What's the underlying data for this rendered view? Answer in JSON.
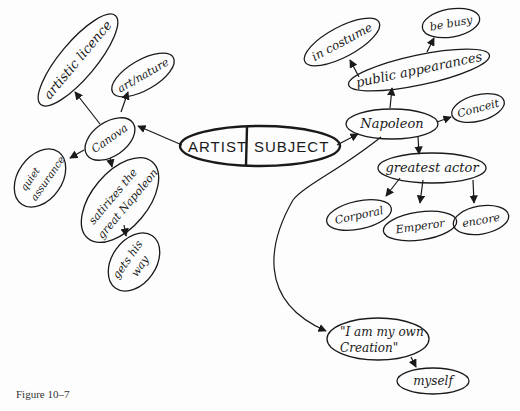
{
  "diagram": {
    "center": {
      "left": "ARTIST",
      "right": "SUBJECT"
    },
    "artist_branch": {
      "root": "Canova",
      "children": [
        {
          "label": "artistic licence"
        },
        {
          "label": "art/nature"
        },
        {
          "label": "quiet assurance"
        },
        {
          "label": "satirizes the great Napoleon",
          "children": [
            {
              "label": "gets his way"
            }
          ]
        }
      ]
    },
    "subject_branch": {
      "root": "Napoleon",
      "children": [
        {
          "label": "public appearances",
          "children": [
            {
              "label": "in costume"
            },
            {
              "label": "be busy"
            }
          ]
        },
        {
          "label": "Conceit"
        },
        {
          "label": "greatest actor",
          "children": [
            {
              "label": "Corporal"
            },
            {
              "label": "Emperor"
            },
            {
              "label": "encore"
            }
          ]
        },
        {
          "label": "\"I am my own Creation\"",
          "children": [
            {
              "label": "myself"
            }
          ]
        }
      ]
    },
    "labels": {
      "artistic_licence": "artistic licence",
      "art_nature": "art/nature",
      "canova": "Canova",
      "quiet_1": "quiet",
      "quiet_2": "assurance",
      "satirizes_1": "satirizes the",
      "satirizes_2": "great Napoleon",
      "gets_1": "gets his",
      "gets_2": "way",
      "napoleon": "Napoleon",
      "public_appearances": "public appearances",
      "in_costume": "in costume",
      "be_busy": "be busy",
      "conceit": "Conceit",
      "greatest_actor": "greatest actor",
      "corporal": "Corporal",
      "emperor": "Emperor",
      "encore": "encore",
      "creation_1": "\"I am my own",
      "creation_2": "Creation\"",
      "myself": "myself"
    }
  },
  "caption": "Figure 10–7"
}
